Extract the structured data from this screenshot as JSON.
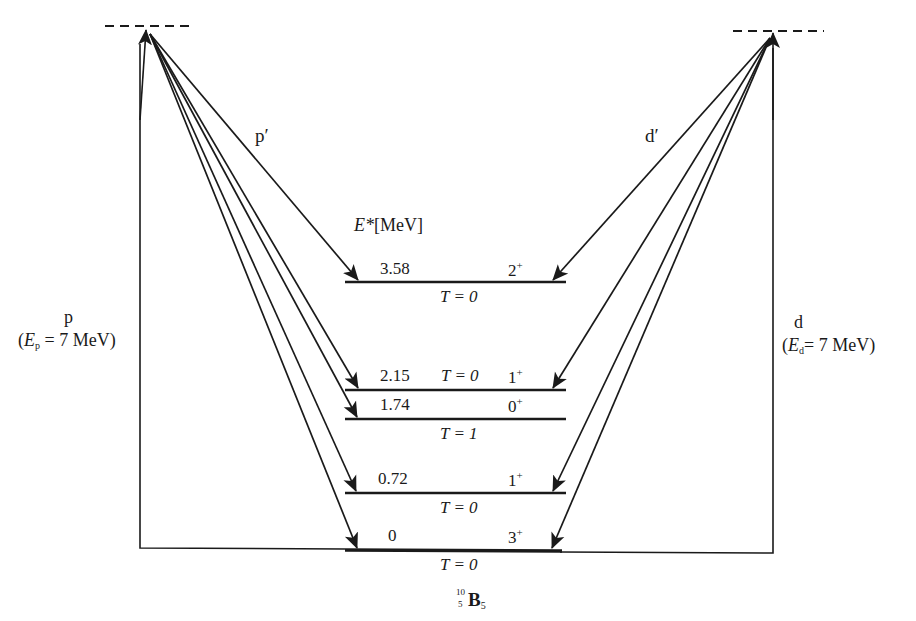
{
  "diagram": {
    "nucleus": {
      "symbol": "B",
      "mass_number": "10",
      "atomic_number": "5",
      "neutron_number": "5"
    },
    "energy_axis_label": {
      "symbol": "E*",
      "unit": "[MeV]"
    },
    "projectiles": {
      "left": {
        "particle": "p",
        "energy_symbol": "E",
        "energy_sub": "p",
        "energy_value": "= 7 MeV",
        "outgoing": "p′"
      },
      "right": {
        "particle": "d",
        "energy_symbol": "E",
        "energy_sub": "d",
        "energy_value": "= 7 MeV",
        "outgoing": "d′"
      }
    },
    "levels": [
      {
        "energy": "3.58",
        "spin_parity": "2",
        "parity": "+",
        "isospin": "T = 0",
        "y": 282,
        "isospin_position": "below"
      },
      {
        "energy": "2.15",
        "spin_parity": "1",
        "parity": "+",
        "isospin": "T = 0",
        "y": 390,
        "isospin_position": "inline"
      },
      {
        "energy": "1.74",
        "spin_parity": "0",
        "parity": "+",
        "isospin": "T = 1",
        "y": 419,
        "isospin_position": "below"
      },
      {
        "energy": "0.72",
        "spin_parity": "1",
        "parity": "+",
        "isospin": "T = 0",
        "y": 493,
        "isospin_position": "below"
      },
      {
        "energy": "0",
        "spin_parity": "3",
        "parity": "+",
        "isospin": "T = 0",
        "y": 549,
        "isospin_position": "below"
      }
    ],
    "colors": {
      "line": "#1a1a1a",
      "background": "#ffffff"
    }
  }
}
